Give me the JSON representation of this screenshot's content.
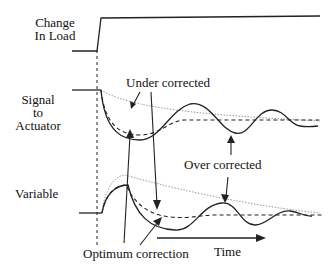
{
  "diagram": {
    "type": "process-control-response",
    "row_labels": {
      "load_line1": "Change",
      "load_line2": "In Load",
      "signal_line1": "Signal",
      "signal_line2": "to",
      "signal_line3": "Actuator",
      "variable": "Variable"
    },
    "annotations": {
      "under_corrected": "Under corrected",
      "over_corrected": "Over corrected",
      "optimum_correction": "Optimum correction",
      "time": "Time"
    },
    "curve_styles": {
      "optimum": "dashed",
      "over_corrected": "solid",
      "under_corrected": "dotted (light)"
    },
    "colors": {
      "line": "#222222",
      "light_line": "#9a9a9a",
      "background": "#ffffff"
    }
  }
}
